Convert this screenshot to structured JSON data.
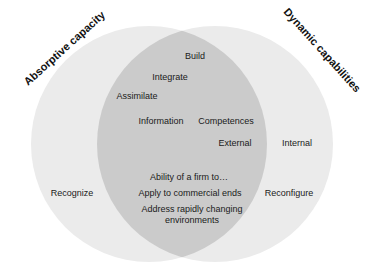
{
  "colors": {
    "background": "#ffffff",
    "circle_fill": "#ebebeb",
    "intersection_fill": "#cbcbcb",
    "text": "#1a1a1a"
  },
  "diagram": {
    "type": "venn",
    "sets": [
      {
        "name": "Absorptive capacity",
        "position": "left"
      },
      {
        "name": "Dynamic capabilities",
        "position": "right"
      }
    ],
    "left_only": [
      "Recognize"
    ],
    "right_only": [
      "Internal",
      "Reconfigure"
    ],
    "intersection": [
      "Build",
      "Integrate",
      "Assimilate",
      "Information",
      "Competences",
      "External",
      "Ability of a firm to…",
      "Apply to commercial ends",
      "Address rapidly changing environments"
    ]
  },
  "labels": {
    "left_title": "Absorptive capacity",
    "right_title": "Dynamic capabilities",
    "build": "Build",
    "integrate": "Integrate",
    "assimilate": "Assimilate",
    "information": "Information",
    "competences": "Competences",
    "external": "External",
    "internal": "Internal",
    "recognize": "Recognize",
    "reconfigure": "Reconfigure",
    "ability": "Ability of a firm to…",
    "apply": "Apply to commercial ends",
    "address_line1": "Address rapidly changing",
    "address_line2": "environments"
  }
}
